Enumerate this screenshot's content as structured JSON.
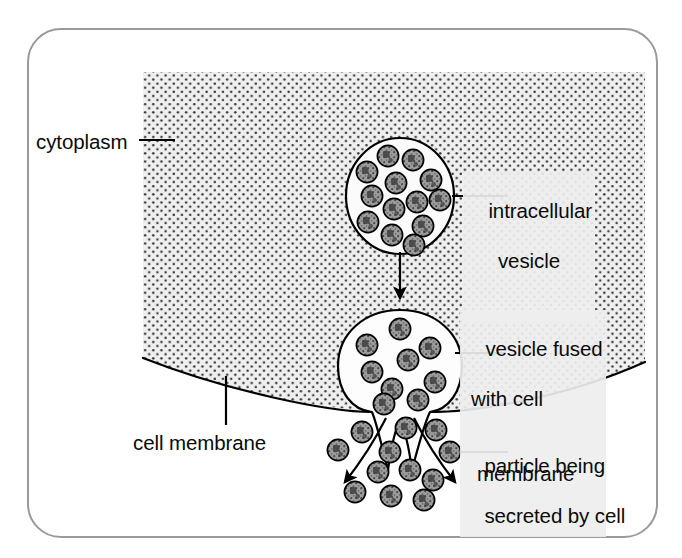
{
  "figure": {
    "frame_color": "#9a9a9a",
    "background_color": "#ffffff",
    "cytoplasm_fill": "#ededed",
    "granule_fill": "#9d9d9d",
    "line_color": "#000000"
  },
  "labels": {
    "cytoplasm": "cytoplasm",
    "intracellular_vesicle_line1": "intracellular",
    "intracellular_vesicle_line2": "vesicle",
    "fused_line1": "vesicle fused",
    "fused_line2": "with cell",
    "fused_line3": "membrane",
    "cell_membrane": "cell membrane",
    "particle_line1": "particle being",
    "particle_line2": "secreted by cell"
  },
  "diagram_data": {
    "type": "biology-process-diagram",
    "process": "exocytosis",
    "stages": [
      {
        "name": "intracellular-vesicle",
        "granule_count": 13,
        "shape": "ellipse",
        "cx": 400,
        "cy": 196,
        "rx": 54,
        "ry": 58
      },
      {
        "name": "fused-vesicle",
        "granule_count": 9,
        "shape": "flask",
        "cx": 400,
        "cy": 378
      },
      {
        "name": "secreted-particles",
        "granule_count": 12,
        "shape": "scatter"
      }
    ],
    "arrows": [
      {
        "name": "transport-arrow",
        "direction": "down",
        "from": [
          400,
          250
        ],
        "to": [
          400,
          302
        ]
      },
      {
        "name": "secretion-arrow-left",
        "direction": "down-left"
      },
      {
        "name": "secretion-arrow-right",
        "direction": "down-right"
      }
    ],
    "regions": [
      {
        "name": "cytoplasm",
        "fill": "stipple",
        "bounded_below_by": "cell-membrane"
      },
      {
        "name": "extracellular-space",
        "fill": "white"
      }
    ]
  }
}
